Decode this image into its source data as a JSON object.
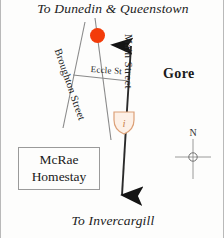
{
  "map": {
    "title": "Gore area road map",
    "background_color": "#fdfdfc",
    "border_color": "#b9b9b9",
    "destinations": {
      "north": "To Dunedin & Queenstown",
      "south": "To Invercargill"
    },
    "town_label": "Gore",
    "streets": [
      {
        "id": "main-street",
        "label": "Main Street"
      },
      {
        "id": "broughton-street",
        "label": "Broughton Street"
      },
      {
        "id": "eccles-street",
        "label": "Eccle St"
      }
    ],
    "callout": {
      "line1": "McRae",
      "line2": "Homestay"
    },
    "compass": {
      "north_label": "N"
    },
    "markers": [
      {
        "id": "red-dot",
        "name": "location-dot-marker",
        "color": "#f33c0a",
        "shape": "circle"
      },
      {
        "id": "info-shield",
        "name": "information-marker",
        "color": "#e8a882",
        "shape": "shield",
        "glyph": "i"
      }
    ],
    "road_color": "#2a2a2a",
    "minor_road_color": "#7d7d7d"
  }
}
